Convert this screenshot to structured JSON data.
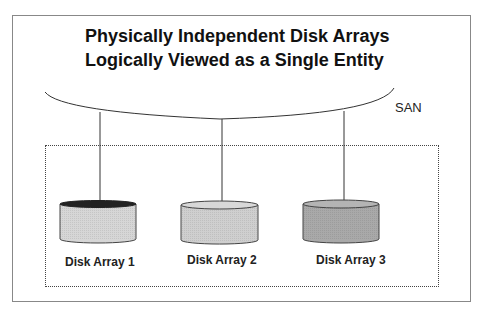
{
  "title": {
    "line1": "Physically Independent Disk Arrays",
    "line2": "Logically Viewed as a Single Entity"
  },
  "network": {
    "label": "SAN"
  },
  "disks": [
    {
      "label": "Disk Array 1",
      "fill": "#d6d6d6",
      "top_fill": "#222222"
    },
    {
      "label": "Disk Array 2",
      "fill": "#cfcfcf",
      "top_fill": "#d8d8d8"
    },
    {
      "label": "Disk Array 3",
      "fill": "#a9a9a9",
      "top_fill": "#b4b4b4"
    }
  ]
}
